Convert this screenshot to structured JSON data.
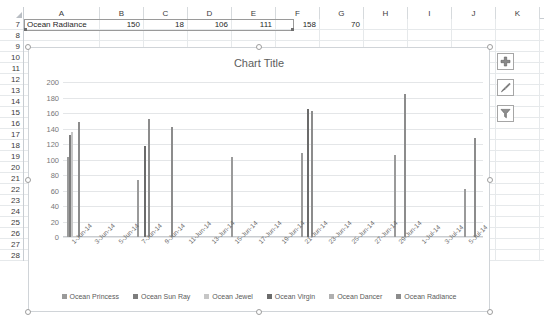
{
  "spreadsheet": {
    "columns": [
      "A",
      "B",
      "C",
      "D",
      "E",
      "F",
      "G",
      "H",
      "I",
      "J",
      "K"
    ],
    "column_widths": [
      76,
      44,
      44,
      44,
      44,
      44,
      44,
      44,
      44,
      44,
      44
    ],
    "rows": [
      "7",
      "8",
      "9",
      "10",
      "11",
      "12",
      "13",
      "14",
      "15",
      "16",
      "17",
      "18",
      "19",
      "20",
      "21",
      "22",
      "23",
      "24",
      "25",
      "26",
      "27",
      "28"
    ],
    "visible_cells": [
      {
        "row": "7",
        "values": [
          "Ocean Radiance",
          "150",
          "18",
          "106",
          "111",
          "158",
          "70",
          "",
          "",
          "",
          ""
        ]
      }
    ],
    "selected_range": "A7:G7"
  },
  "chart_tools": {
    "elements_label": "Chart Elements",
    "styles_label": "Chart Styles",
    "filters_label": "Chart Filters"
  },
  "chart_data": {
    "type": "bar",
    "title": "Chart Title",
    "xlabel": "",
    "ylabel": "",
    "ylim": [
      0,
      200
    ],
    "yticks": [
      0,
      20,
      40,
      60,
      80,
      100,
      120,
      140,
      160,
      180,
      200
    ],
    "grid": true,
    "legend_position": "bottom",
    "categories": [
      "1-Jun-14",
      "3-Jun-14",
      "5-Jun-14",
      "7-Jun-14",
      "9-Jun-14",
      "11-Jun-14",
      "13-Jun-14",
      "15-Jun-14",
      "17-Jun-14",
      "19-Jun-14",
      "21-Jun-14",
      "23-Jun-14",
      "25-Jun-14",
      "27-Jun-14",
      "29-Jun-14",
      "1-Jul-14",
      "3-Jul-14",
      "5-Jul-14"
    ],
    "series": [
      {
        "name": "Ocean Princess",
        "color": "#9a9a9a",
        "values": [
          103,
          0,
          0,
          74,
          0,
          0,
          0,
          103,
          0,
          0,
          108,
          0,
          0,
          0,
          106,
          0,
          0,
          62
        ]
      },
      {
        "name": "Ocean Sun Ray",
        "color": "#7d7d7d",
        "values": [
          132,
          0,
          0,
          0,
          0,
          0,
          0,
          0,
          0,
          0,
          0,
          0,
          0,
          0,
          0,
          0,
          0,
          0
        ]
      },
      {
        "name": "Ocean Jewel",
        "color": "#c6c6c6",
        "values": [
          136,
          0,
          0,
          0,
          0,
          0,
          0,
          0,
          0,
          0,
          0,
          0,
          0,
          0,
          0,
          0,
          0,
          0
        ]
      },
      {
        "name": "Ocean Virgin",
        "color": "#6b6b6b",
        "values": [
          0,
          0,
          0,
          117,
          0,
          0,
          0,
          0,
          0,
          0,
          165,
          0,
          0,
          0,
          0,
          0,
          0,
          0
        ]
      },
      {
        "name": "Ocean Dancer",
        "color": "#b0b0b0",
        "values": [
          0,
          0,
          0,
          0,
          0,
          0,
          0,
          0,
          0,
          0,
          0,
          0,
          0,
          0,
          0,
          0,
          0,
          0
        ]
      },
      {
        "name": "Ocean Radiance",
        "color": "#8c8c8c",
        "values": [
          149,
          0,
          0,
          152,
          142,
          0,
          0,
          0,
          0,
          0,
          163,
          0,
          0,
          0,
          185,
          0,
          0,
          128
        ]
      }
    ]
  }
}
